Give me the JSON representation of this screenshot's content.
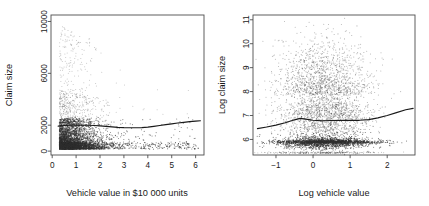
{
  "figure": {
    "background_color": "#ffffff",
    "point_color": "#303030",
    "axis_color": "#4d4d4d",
    "curve_color": "#1a1a1a"
  },
  "chart_data": [
    {
      "type": "scatter",
      "panel": "left",
      "title": "",
      "xlabel": "Vehicle value in $10 000 units",
      "ylabel": "Claim size",
      "xlim": [
        -0.05,
        6.35
      ],
      "ylim": [
        -300,
        10500
      ],
      "xticks": [
        0,
        1,
        2,
        3,
        4,
        5,
        6
      ],
      "xticklabels": [
        "0",
        "1",
        "2",
        "3",
        "4",
        "5",
        "6"
      ],
      "yticks": [
        0,
        2000,
        6000,
        10000
      ],
      "yticklabels": [
        "0",
        "2000",
        "6000",
        "10000"
      ],
      "grid": false,
      "legend": "none",
      "point_count": 4624,
      "notes": "Dense cluster of small claim sizes (0-2500) concentrated at vehicle values 0.3-2.5; sparse points scatter upward to 10000, mostly at vehicle values below 2.5.",
      "smoother": {
        "name": "lowess",
        "x": [
          0.25,
          0.5,
          0.75,
          1.0,
          1.25,
          1.5,
          1.75,
          2.0,
          2.25,
          2.5,
          2.75,
          3.0,
          3.25,
          3.5,
          3.75,
          4.0,
          4.25,
          4.5,
          4.75,
          5.0,
          5.25,
          5.5,
          5.75,
          6.0,
          6.2
        ],
        "y": [
          1930,
          1975,
          2000,
          2010,
          2005,
          1995,
          1975,
          1945,
          1910,
          1870,
          1835,
          1812,
          1800,
          1800,
          1815,
          1855,
          1910,
          1975,
          2040,
          2105,
          2165,
          2220,
          2270,
          2315,
          2345
        ]
      }
    },
    {
      "type": "scatter",
      "panel": "right",
      "title": "",
      "xlabel": "Log vehicle value",
      "ylabel": "Log claim size",
      "xlim": [
        -1.62,
        2.75
      ],
      "ylim": [
        5.35,
        11.2
      ],
      "xticks": [
        -1,
        0,
        1,
        2
      ],
      "xticklabels": [
        "−1",
        "0",
        "1",
        "2"
      ],
      "yticks": [
        6,
        7,
        8,
        9,
        10,
        11
      ],
      "yticklabels": [
        "6",
        "7",
        "8",
        "9",
        "10",
        "11"
      ],
      "grid": false,
      "legend": "none",
      "point_count": 4624,
      "notes": "Cloud centred near log vehicle value 0.4 and log claim size 7.2; prominent dense horizontal band at log claim size 5.9 and a thin line of points near 5.45.",
      "smoother": {
        "name": "lowess",
        "x": [
          -1.5,
          -1.25,
          -1.0,
          -0.75,
          -0.5,
          -0.35,
          -0.2,
          0.0,
          0.25,
          0.5,
          0.75,
          1.0,
          1.25,
          1.5,
          1.75,
          2.0,
          2.25,
          2.5,
          2.7
        ],
        "y": [
          6.45,
          6.52,
          6.6,
          6.7,
          6.82,
          6.88,
          6.85,
          6.8,
          6.78,
          6.79,
          6.8,
          6.8,
          6.8,
          6.83,
          6.9,
          7.0,
          7.12,
          7.24,
          7.3
        ]
      }
    }
  ]
}
